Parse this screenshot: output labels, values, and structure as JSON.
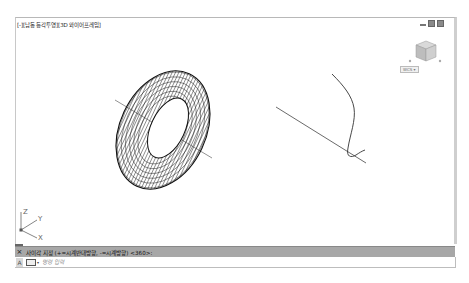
{
  "viewport": {
    "label": "[-][남동 등각투영][3D 와이어프레임]",
    "window_controls": [
      "minimize-icon",
      "restore-icon",
      "close-icon"
    ],
    "viewcube": {
      "label": "WCS",
      "icon": "viewcube-icon"
    },
    "ucs_icon": {
      "axes": [
        "X",
        "Y",
        "Z"
      ]
    },
    "objects": [
      {
        "type": "torus-wireframe",
        "name": "torus"
      },
      {
        "type": "line",
        "name": "axis-line-1"
      },
      {
        "type": "polyline",
        "name": "revolve-path-curve"
      },
      {
        "type": "line",
        "name": "axis-line-2"
      }
    ]
  },
  "command_line": {
    "close_icon": "×",
    "history_text": "사이각 지정 (+=시계반대방향, -=시계방향) <360>:",
    "customize_icon": "A",
    "placeholder": "명령 입력"
  },
  "colors": {
    "command_bar": "#a7a7a7",
    "background": "#ffffff",
    "wire": "#111111"
  }
}
